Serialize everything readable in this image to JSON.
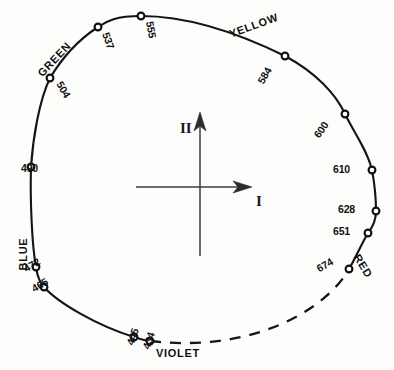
{
  "figure": {
    "background_color": "#fdfdfc",
    "ink_color": "#141414",
    "axes": {
      "horizontal_label": "I",
      "vertical_label": "II",
      "origin": [
        200,
        187
      ],
      "horizontal_span": [
        136,
        252
      ],
      "vertical_span": [
        112,
        256
      ],
      "horizontal_arrow": "right",
      "vertical_arrow": "up"
    },
    "hue_labels": [
      {
        "text": "YELLOW",
        "x": 255,
        "y": 29,
        "rotate": -20
      },
      {
        "text": "GREEN",
        "x": 57,
        "y": 62,
        "rotate": -47
      },
      {
        "text": "BLUE",
        "x": 27,
        "y": 254,
        "rotate": -90
      },
      {
        "text": "RED",
        "x": 360,
        "y": 268,
        "rotate": 58
      },
      {
        "text": "VIOLET",
        "x": 178,
        "y": 357,
        "rotate": 0
      }
    ],
    "wavelength_points": [
      {
        "label": "555",
        "x": 141,
        "y": 16,
        "lx": 146,
        "ly": 22,
        "rotate": 80
      },
      {
        "label": "537",
        "x": 98,
        "y": 27,
        "lx": 102,
        "ly": 34,
        "rotate": 70
      },
      {
        "label": "504",
        "x": 50,
        "y": 78,
        "lx": 56,
        "ly": 84,
        "rotate": 60
      },
      {
        "label": "490",
        "x": 31,
        "y": 167,
        "lx": 38,
        "ly": 172,
        "rotate": 0
      },
      {
        "label": "472",
        "x": 36,
        "y": 267,
        "lx": 41,
        "ly": 264,
        "rotate": -30
      },
      {
        "label": "465",
        "x": 44,
        "y": 287,
        "lx": 49,
        "ly": 284,
        "rotate": -30
      },
      {
        "label": "445",
        "x": 134,
        "y": 337,
        "lx": 139,
        "ly": 330,
        "rotate": -70
      },
      {
        "label": "434",
        "x": 150,
        "y": 341,
        "lx": 155,
        "ly": 334,
        "rotate": -70
      },
      {
        "label": "674",
        "x": 349,
        "y": 269,
        "lx": 334,
        "ly": 264,
        "rotate": -30
      },
      {
        "label": "651",
        "x": 368,
        "y": 233,
        "lx": 350,
        "ly": 235,
        "rotate": 0
      },
      {
        "label": "628",
        "x": 376,
        "y": 211,
        "lx": 355,
        "ly": 213,
        "rotate": 0
      },
      {
        "label": "610",
        "x": 372,
        "y": 170,
        "lx": 350,
        "ly": 173,
        "rotate": 0
      },
      {
        "label": "600",
        "x": 345,
        "y": 114,
        "lx": 329,
        "ly": 125,
        "rotate": -55
      },
      {
        "label": "584",
        "x": 285,
        "y": 56,
        "lx": 272,
        "ly": 70,
        "rotate": -60
      }
    ],
    "spectrum_locus_path": "M 141 16 C 113 16 106 22 98 27 C 78 40 62 58 50 78 C 39 101 33 138 31 167 C 30 200 32 246 36 267 C 38 280 41 283 44 287 C 58 303 98 326 134 337 C 140 339 146 341 150 341",
    "spectrum_locus_right_path": "M 141 16 C 180 16 230 29 285 56 C 315 72 336 94 345 114 C 356 136 368 152 372 170 C 375 186 376 200 376 211 C 376 222 372 228 368 233 C 362 243 355 259 349 269",
    "purple_line_path": "M 150 341 C 200 347 250 340 290 320 C 322 304 340 285 349 269",
    "curve_style": {
      "solid_stroke_width": 2.1,
      "dashed_pattern": "11 9"
    }
  }
}
